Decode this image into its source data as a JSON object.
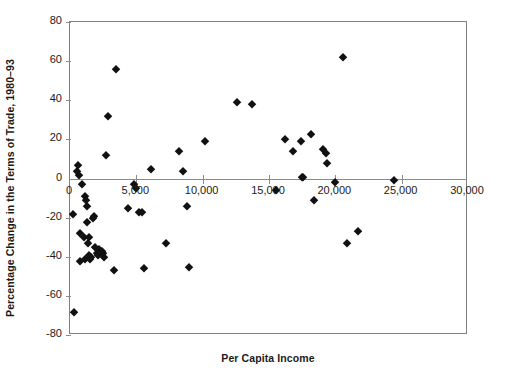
{
  "chart_data": {
    "type": "scatter",
    "title": "",
    "xlabel": "Per Capita Income",
    "ylabel": "Percentage Change in the Terms of Trade, 1980–93",
    "xlim": [
      0,
      30000
    ],
    "ylim": [
      -80,
      80
    ],
    "xticks": [
      0,
      5000,
      10000,
      15000,
      20000,
      25000,
      30000
    ],
    "xtick_labels": [
      "0",
      "5,000",
      "10,000",
      "15,000",
      "20,000",
      "25,000",
      "30,000"
    ],
    "yticks": [
      80,
      60,
      40,
      20,
      0,
      -20,
      -40,
      -60,
      -80
    ],
    "ytick_labels": [
      "80",
      "60",
      "40",
      "20",
      "0",
      "-20",
      "-40",
      "-60",
      "-80"
    ],
    "grid": false,
    "legend": null,
    "marker": "diamond",
    "marker_color": "#111111",
    "axis_color": "#808080",
    "points": [
      [
        330,
        -68
      ],
      [
        240,
        -18
      ],
      [
        560,
        4
      ],
      [
        600,
        7
      ],
      [
        650,
        2
      ],
      [
        720,
        -28
      ],
      [
        790,
        -42
      ],
      [
        900,
        -3
      ],
      [
        1050,
        -30
      ],
      [
        1100,
        -41
      ],
      [
        1150,
        -9
      ],
      [
        1200,
        -11
      ],
      [
        1250,
        -14
      ],
      [
        1300,
        -22
      ],
      [
        1350,
        -33
      ],
      [
        1400,
        -30
      ],
      [
        1450,
        -39
      ],
      [
        1500,
        -41
      ],
      [
        1600,
        -40
      ],
      [
        1700,
        -20
      ],
      [
        1800,
        -19
      ],
      [
        1900,
        -35
      ],
      [
        2000,
        -38
      ],
      [
        2100,
        -39
      ],
      [
        2200,
        -36
      ],
      [
        2400,
        -37
      ],
      [
        2500,
        -38
      ],
      [
        2600,
        -40
      ],
      [
        2700,
        12
      ],
      [
        2900,
        32
      ],
      [
        3300,
        -47
      ],
      [
        3500,
        56
      ],
      [
        4400,
        -15
      ],
      [
        4800,
        -3
      ],
      [
        5000,
        -5
      ],
      [
        5200,
        -17
      ],
      [
        5400,
        -17
      ],
      [
        5600,
        -46
      ],
      [
        6100,
        5
      ],
      [
        7200,
        -33
      ],
      [
        8200,
        14
      ],
      [
        8500,
        4
      ],
      [
        8800,
        -14
      ],
      [
        9000,
        -45
      ],
      [
        10200,
        19
      ],
      [
        12600,
        39
      ],
      [
        13700,
        38
      ],
      [
        15500,
        -6
      ],
      [
        16200,
        20
      ],
      [
        16800,
        14
      ],
      [
        17400,
        19
      ],
      [
        17500,
        1
      ],
      [
        17600,
        1
      ],
      [
        18200,
        23
      ],
      [
        18400,
        -11
      ],
      [
        19100,
        15
      ],
      [
        19300,
        13
      ],
      [
        19400,
        8
      ],
      [
        20000,
        -2
      ],
      [
        20600,
        62
      ],
      [
        20900,
        -33
      ],
      [
        21700,
        -27
      ],
      [
        24400,
        -1
      ]
    ]
  }
}
